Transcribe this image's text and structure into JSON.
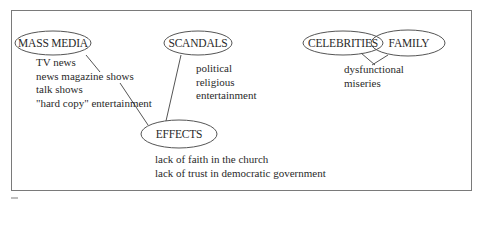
{
  "diagram": {
    "type": "concept-map",
    "nodes": {
      "mass_media": {
        "label": "MASS MEDIA",
        "cx": 53,
        "cy": 43,
        "rx": 38,
        "ry": 12
      },
      "scandals": {
        "label": "SCANDALS",
        "cx": 198,
        "cy": 43,
        "rx": 34,
        "ry": 12
      },
      "celebrities": {
        "label": "CELEBRITIES",
        "cx": 343,
        "cy": 43,
        "rx": 40,
        "ry": 12
      },
      "family": {
        "label": "FAMILY",
        "cx": 408,
        "cy": 43,
        "rx": 37,
        "ry": 13
      },
      "effects": {
        "label": "EFFECTS",
        "cx": 179,
        "cy": 134,
        "rx": 38,
        "ry": 14
      }
    },
    "lists": {
      "mass_media_items": [
        "TV news",
        "news magazine shows",
        "talk shows",
        "\"hard copy\" entertainment"
      ],
      "scandals_items": [
        "political",
        "religious",
        "entertainment"
      ],
      "celebrities_family_items": [
        "dysfunctional",
        "miseries"
      ],
      "effects_items": [
        "lack of faith in the church",
        "lack of trust in democratic government"
      ]
    },
    "edges": [
      {
        "from": "mass_media",
        "to": "mass_media_items",
        "x1": 86,
        "y1": 55,
        "x2": 100,
        "y2": 72
      },
      {
        "from": "mass_media_items",
        "to": "effects",
        "x1": 120,
        "y1": 83,
        "x2": 148,
        "y2": 125
      },
      {
        "from": "scandals",
        "to": "effects",
        "x1": 181,
        "y1": 55,
        "x2": 166,
        "y2": 121
      },
      {
        "from": "celebrities",
        "to": "celebrities_family_items",
        "x1": 361,
        "y1": 53,
        "x2": 375,
        "y2": 65
      },
      {
        "from": "family",
        "to": "celebrities_family_items",
        "x1": 388,
        "y1": 55,
        "x2": 372,
        "y2": 65
      }
    ],
    "colors": {
      "stroke": "#555555",
      "text": "#2a2a2a",
      "frame": "#7a7a7a",
      "background": "#ffffff"
    }
  }
}
